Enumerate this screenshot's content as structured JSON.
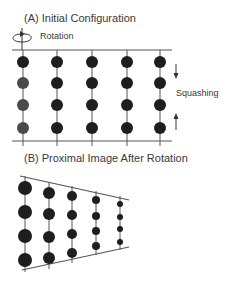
{
  "panel_a": {
    "title": "(A) Initial Configuration",
    "rotation_label": "Rotation",
    "squashing_label": "Squashing",
    "columns_x": [
      23,
      57,
      92,
      127,
      160
    ],
    "rows_y": [
      62,
      83,
      105,
      128
    ],
    "dot_radius": 6
  },
  "panel_b": {
    "title": "(B) Proximal Image After Rotation",
    "columns": [
      {
        "x": 25,
        "r": 7,
        "ys": [
          188,
          212,
          236,
          260
        ]
      },
      {
        "x": 49,
        "r": 6,
        "ys": [
          193,
          214,
          237,
          258
        ]
      },
      {
        "x": 72,
        "r": 5,
        "ys": [
          196,
          215,
          234,
          253
        ]
      },
      {
        "x": 96,
        "r": 4,
        "ys": [
          200,
          216,
          231,
          246
        ]
      },
      {
        "x": 120,
        "r": 3,
        "ys": [
          204,
          217,
          229,
          242
        ]
      }
    ]
  },
  "colors": {
    "dot": "#1e1e1e",
    "dot_faded": "#4a4a4a",
    "line": "#555555",
    "text": "#3a3a3a"
  }
}
